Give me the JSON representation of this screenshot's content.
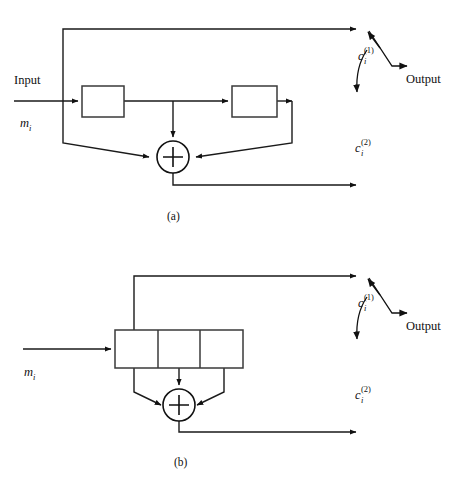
{
  "figure": {
    "name": "convolutional-encoder-diagrams",
    "background": "#ffffff",
    "line_color": "#1a1a1a",
    "panels": [
      {
        "id": "a",
        "caption": "(a)",
        "labels": {
          "input": "Input",
          "message_symbol": "m",
          "message_subscript": "i",
          "output": "Output",
          "code1_symbol": "c",
          "code1_subscript": "i",
          "code1_superscript": "(1)",
          "code2_symbol": "c",
          "code2_subscript": "i",
          "code2_superscript": "(2)"
        },
        "elements": {
          "delay_boxes": 2,
          "adders": 1,
          "adder_glyph": "plus",
          "outputs": 2
        }
      },
      {
        "id": "b",
        "caption": "(b)",
        "labels": {
          "message_symbol": "m",
          "message_subscript": "i",
          "output": "Output",
          "code1_symbol": "c",
          "code1_subscript": "i",
          "code1_superscript": "(1)",
          "code2_symbol": "c",
          "code2_subscript": "i",
          "code2_superscript": "(2)"
        },
        "elements": {
          "shift_register_cells": 3,
          "adders": 1,
          "adder_glyph": "plus",
          "outputs": 2
        }
      }
    ]
  }
}
